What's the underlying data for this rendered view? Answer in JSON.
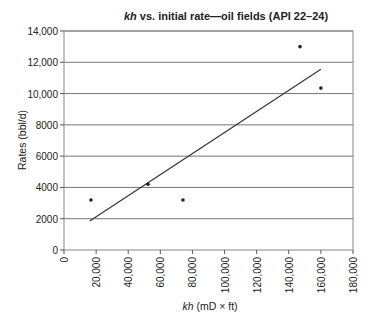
{
  "chart_data": {
    "type": "scatter",
    "title_italic": "kh",
    "title_rest": " vs. initial rate—oil fields (API 22–24)",
    "xlabel_italic": "kh",
    "xlabel_rest": " (mD × ft)",
    "ylabel": "Rates (bbl/d)",
    "xlim": [
      0,
      180000
    ],
    "ylim": [
      0,
      14000
    ],
    "x_ticks": [
      "0",
      "20,000",
      "40,000",
      "60,000",
      "80,000",
      "100,000",
      "120,000",
      "140,000",
      "160,000",
      "180,000"
    ],
    "y_ticks": [
      "0",
      "2000",
      "4000",
      "6000",
      "8000",
      "10,000",
      "12,000",
      "14,000"
    ],
    "grid": "horizontal",
    "legend": "none",
    "series": [
      {
        "name": "Oil fields",
        "points": [
          {
            "x": 16800,
            "y": 3200
          },
          {
            "x": 52300,
            "y": 4200
          },
          {
            "x": 74100,
            "y": 3200
          },
          {
            "x": 147000,
            "y": 13000
          },
          {
            "x": 160000,
            "y": 10350
          }
        ]
      }
    ],
    "trendline": {
      "type": "linear",
      "x0": 16000,
      "y0": 1850,
      "x1": 160000,
      "y1": 11550
    }
  }
}
